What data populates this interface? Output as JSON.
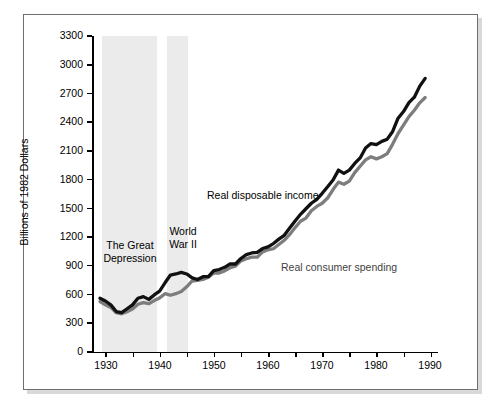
{
  "figure": {
    "frame": true,
    "background": "#ffffff",
    "shadow_color": "#d9d9d9"
  },
  "chart_data": {
    "type": "line",
    "title": "",
    "xlabel": "",
    "ylabel": "Billions of 1982 Dollars",
    "xlim": [
      1929,
      1990
    ],
    "ylim": [
      0,
      3450
    ],
    "grid": false,
    "legend_position": "inline-annotation",
    "y_ticks": [
      0,
      300,
      600,
      900,
      1200,
      1500,
      1800,
      2100,
      2400,
      2700,
      3000,
      3300
    ],
    "y_tick_labels": [
      "0",
      "300",
      "600",
      "900",
      "1200",
      "1500",
      "1800",
      "2100",
      "2400",
      "2700",
      "3000",
      "3300"
    ],
    "x_ticks": [
      1930,
      1935,
      1940,
      1945,
      1950,
      1955,
      1960,
      1965,
      1970,
      1975,
      1980,
      1985,
      1990
    ],
    "x_tick_labels_major": [
      "1930",
      "1940",
      "1950",
      "1960",
      "1970",
      "1980",
      "1990"
    ],
    "x_major_ticks": [
      1930,
      1940,
      1950,
      1960,
      1970,
      1980,
      1990
    ],
    "shaded_regions": [
      {
        "name": "The Great Depression",
        "start": 1929.3,
        "end": 1939.5,
        "color": "#ebebeb"
      },
      {
        "name": "World War II",
        "start": 1941.3,
        "end": 1945.3,
        "color": "#ebebeb"
      }
    ],
    "annotations": [
      {
        "name": "depression-label",
        "text": "The Great\nDepression",
        "line1": "The Great",
        "line2": "Depression"
      },
      {
        "name": "world-war-2-label",
        "text": "World\nWar II",
        "line1": "World",
        "line2": "War II"
      },
      {
        "name": "income-series-label",
        "text": "Real disposable income"
      },
      {
        "name": "spending-series-label",
        "text": "Real consumer spending"
      }
    ],
    "x": [
      1929,
      1930,
      1931,
      1932,
      1933,
      1934,
      1935,
      1936,
      1937,
      1938,
      1939,
      1940,
      1941,
      1942,
      1943,
      1944,
      1945,
      1946,
      1947,
      1948,
      1949,
      1950,
      1951,
      1952,
      1953,
      1954,
      1955,
      1956,
      1957,
      1958,
      1959,
      1960,
      1961,
      1962,
      1963,
      1964,
      1965,
      1966,
      1967,
      1968,
      1969,
      1970,
      1971,
      1972,
      1973,
      1974,
      1975,
      1976,
      1977,
      1978,
      1979,
      1980,
      1981,
      1982,
      1983,
      1984,
      1985,
      1986,
      1987,
      1988,
      1989
    ],
    "series": [
      {
        "name": "Real disposable income",
        "color": "#111111",
        "values": [
          480,
          455,
          420,
          360,
          350,
          385,
          420,
          480,
          495,
          470,
          510,
          545,
          620,
          690,
          700,
          715,
          700,
          665,
          650,
          675,
          675,
          730,
          740,
          760,
          790,
          790,
          840,
          875,
          890,
          895,
          930,
          945,
          975,
          1015,
          1050,
          1115,
          1180,
          1240,
          1290,
          1340,
          1375,
          1430,
          1490,
          1550,
          1640,
          1610,
          1640,
          1700,
          1750,
          1840,
          1880,
          1870,
          1900,
          1920,
          1990,
          2110,
          2170,
          2250,
          2300,
          2400,
          2470
        ],
        "style": "solid",
        "width": 3.2
      },
      {
        "name": "Real consumer spending",
        "color": "#7d7d7d",
        "values": [
          470,
          440,
          415,
          365,
          355,
          375,
          400,
          445,
          460,
          450,
          480,
          505,
          545,
          530,
          545,
          565,
          610,
          665,
          670,
          680,
          700,
          740,
          740,
          760,
          790,
          805,
          855,
          875,
          890,
          890,
          940,
          960,
          970,
          1010,
          1050,
          1105,
          1170,
          1230,
          1260,
          1330,
          1370,
          1400,
          1450,
          1530,
          1600,
          1580,
          1610,
          1690,
          1750,
          1810,
          1840,
          1820,
          1840,
          1870,
          1960,
          2060,
          2140,
          2220,
          2280,
          2350,
          2400
        ],
        "style": "solid",
        "width": 3.2
      }
    ],
    "series_end_values": {
      "real_disposable_income_1989": 2850,
      "real_consumer_spending_1989": 2650
    }
  }
}
